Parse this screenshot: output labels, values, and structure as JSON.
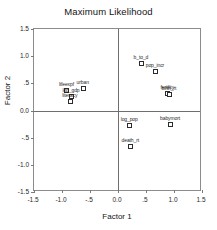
{
  "chart_data": {
    "type": "scatter",
    "title": "Maximum Likelihood",
    "xlabel": "Factor 1",
    "ylabel": "Factor 2",
    "xlim": [
      -1.5,
      1.5
    ],
    "ylim": [
      -1.5,
      1.5
    ],
    "grid": false,
    "legend": null,
    "xticks": [
      {
        "value": -1.5,
        "label": "-1.5"
      },
      {
        "value": -1.0,
        "label": "-1.0"
      },
      {
        "value": -0.5,
        "label": "-.5"
      },
      {
        "value": 0.0,
        "label": "0.0"
      },
      {
        "value": 0.5,
        "label": ".5"
      },
      {
        "value": 1.0,
        "label": "1.0"
      },
      {
        "value": 1.5,
        "label": "1.5"
      }
    ],
    "yticks": [
      {
        "value": 1.5,
        "label": "1.5"
      },
      {
        "value": 1.0,
        "label": "1.0"
      },
      {
        "value": 0.5,
        "label": ".5"
      },
      {
        "value": 0.0,
        "label": "0.0"
      },
      {
        "value": -0.5,
        "label": "-.5"
      },
      {
        "value": -1.0,
        "label": "-1.0"
      },
      {
        "value": -1.5,
        "label": "-1.5"
      }
    ],
    "points": [
      {
        "label": "b_to_d",
        "x": 0.41,
        "y": 0.88
      },
      {
        "label": "pop_incr",
        "x": 0.66,
        "y": 0.72
      },
      {
        "label": "fertility",
        "x": 0.88,
        "y": 0.33
      },
      {
        "label": "birth_rt",
        "x": 0.91,
        "y": 0.31
      },
      {
        "label": "urban",
        "x": -0.63,
        "y": 0.42
      },
      {
        "label": "lifeexpf",
        "x": -0.92,
        "y": 0.38
      },
      {
        "label": "log_gdp",
        "x": -0.84,
        "y": 0.27
      },
      {
        "label": "literacy",
        "x": -0.86,
        "y": 0.17
      },
      {
        "label": "log_pop",
        "x": 0.2,
        "y": -0.27
      },
      {
        "label": "babymort",
        "x": 0.93,
        "y": -0.25
      },
      {
        "label": "death_rt",
        "x": 0.22,
        "y": -0.66
      }
    ]
  },
  "style": {
    "frame_color": "#8c8c8c",
    "axis_color": "#6e6e6e",
    "marker_edge": "#2b2b2b",
    "marker_fill": "#ffffff",
    "text_color": "#1a1a1a"
  }
}
